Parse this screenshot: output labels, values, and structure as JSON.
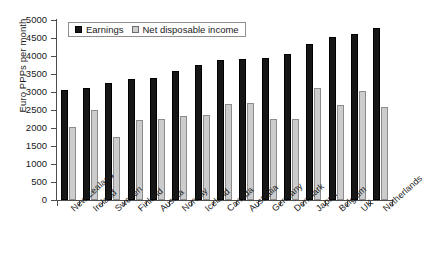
{
  "chart_data": {
    "type": "bar",
    "title": "",
    "xlabel": "",
    "ylabel": "Euro PPPs per month",
    "ylim": [
      0,
      5000
    ],
    "ytick_step": 500,
    "yticks": [
      "5000",
      "4500",
      "4000",
      "3500",
      "3000",
      "2500",
      "2000",
      "1500",
      "1000",
      "500",
      "0"
    ],
    "grid": false,
    "legend_position": "top-left-inside",
    "categories": [
      "New Zealand",
      "Ireland",
      "Sweden",
      "Finland",
      "Austria",
      "Norway",
      "Iceland",
      "Canada",
      "Australia",
      "Germany",
      "Denmark",
      "Japan",
      "Belgium",
      "UK",
      "Netherlands"
    ],
    "series": [
      {
        "name": "Earnings",
        "color": "#161616",
        "values": [
          3060,
          3110,
          3250,
          3350,
          3400,
          3580,
          3740,
          3880,
          3920,
          3940,
          4060,
          4340,
          4540,
          4610,
          4790
        ]
      },
      {
        "name": "Net disposable income",
        "color": "#cccccc",
        "values": [
          2030,
          2490,
          1750,
          2220,
          2250,
          2320,
          2350,
          2660,
          2700,
          2250,
          2260,
          3120,
          2650,
          3020,
          2580
        ]
      }
    ]
  },
  "legend": {
    "items": [
      {
        "label": "Earnings",
        "swatch": "black-square-icon"
      },
      {
        "label": "Net disposable income",
        "swatch": "gray-square-icon"
      }
    ]
  },
  "axes": {
    "y_title": "Euro PPPs per month"
  }
}
